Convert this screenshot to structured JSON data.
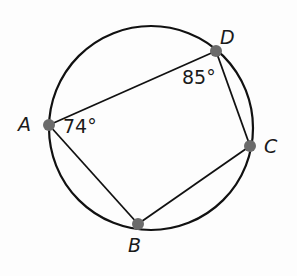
{
  "diagram": {
    "type": "cyclic-quadrilateral",
    "circle": {
      "cx": 151,
      "cy": 128,
      "r": 102,
      "stroke": "#111111"
    },
    "points": [
      {
        "name": "A",
        "x": 49,
        "y": 125
      },
      {
        "name": "B",
        "x": 138,
        "y": 224
      },
      {
        "name": "C",
        "x": 250,
        "y": 146
      },
      {
        "name": "D",
        "x": 216,
        "y": 51
      }
    ],
    "point_color": "#6b6b6b",
    "segments": [
      [
        "A",
        "D"
      ],
      [
        "D",
        "C"
      ],
      [
        "C",
        "B"
      ],
      [
        "B",
        "A"
      ]
    ],
    "labels": {
      "A": "A",
      "B": "B",
      "C": "C",
      "D": "D"
    },
    "angles": {
      "A": "74°",
      "D": "85°"
    }
  }
}
